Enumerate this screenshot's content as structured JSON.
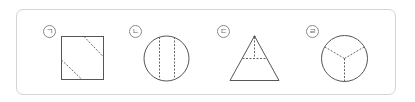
{
  "figures": [
    {
      "label": "ㄱ",
      "shape": "square",
      "folds": "two diagonal dashed lines cutting opposite corners"
    },
    {
      "label": "ㄴ",
      "shape": "circle",
      "folds": "two parallel vertical dashed lines"
    },
    {
      "label": "ㄷ",
      "shape": "triangle",
      "folds": "horizontal dashed line and vertical dashed line from apex"
    },
    {
      "label": "ㄹ",
      "shape": "circle",
      "folds": "three dashed radii from center"
    }
  ],
  "colors": {
    "line": "#555555",
    "dash": "#666666",
    "border": "#d4d4d4"
  }
}
